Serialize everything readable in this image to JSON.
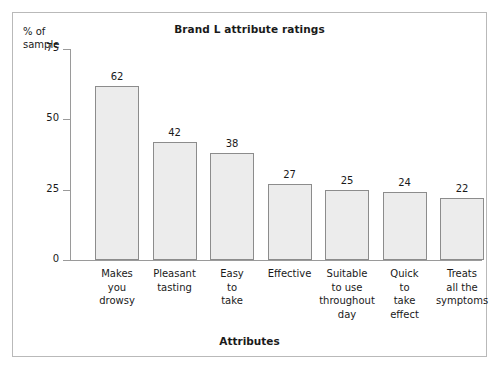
{
  "chart_data": {
    "type": "bar",
    "title": "Brand L attribute ratings",
    "xlabel": "Attributes",
    "ylabel": "% of\nsample",
    "categories": [
      "Makes\nyou\ndrowsy",
      "Pleasant\ntasting",
      "Easy\nto\ntake",
      "Effective",
      "Suitable\nto use\nthroughout\nday",
      "Quick\nto\ntake\neffect",
      "Treats\nall the\nsymptoms"
    ],
    "values": [
      62,
      42,
      38,
      27,
      25,
      24,
      22
    ],
    "value_labels": [
      "62",
      "42",
      "38",
      "27",
      "25",
      "24",
      "22"
    ],
    "ylim": [
      0,
      75
    ],
    "yticks": [
      0,
      25,
      50,
      75
    ],
    "ytick_labels": [
      "0",
      "25",
      "50",
      "75"
    ],
    "grid": false,
    "legend": null,
    "bar_fill_color": "#ececec",
    "bar_border_color": "#8c8c8c",
    "axis_color": "#9a9a9a",
    "frame_color": "#b9b9b9",
    "background_color": "#ffffff"
  }
}
